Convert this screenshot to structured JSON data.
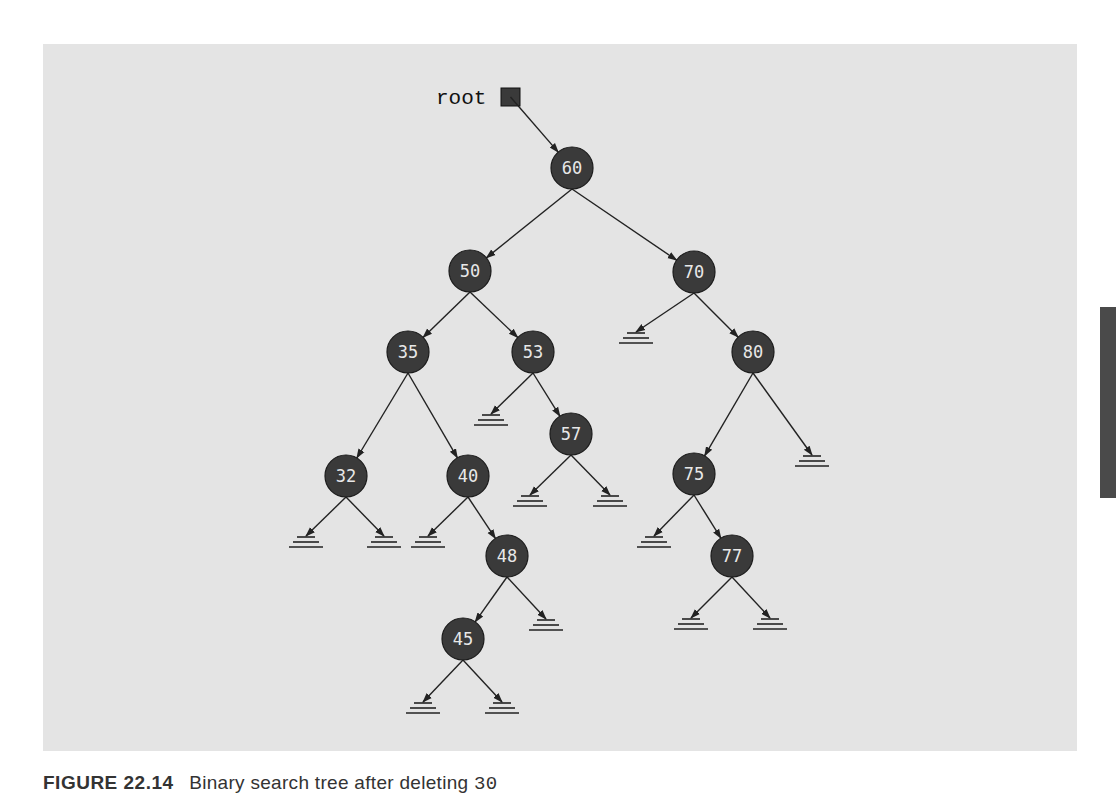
{
  "diagram": {
    "type": "binary-search-tree",
    "root_label": "root",
    "colors": {
      "panel": "#e4e4e4",
      "node_fill": "#3a3a3a",
      "node_text": "#e8e8e8",
      "edge": "#222222",
      "side_tab": "#4a4a4a"
    },
    "root_pointer": {
      "box": [
        501,
        88,
        19,
        18
      ],
      "label_pos": [
        436,
        104
      ]
    },
    "node_radius": 21,
    "nodes": [
      {
        "id": "60",
        "label": "60",
        "x": 572,
        "y": 168
      },
      {
        "id": "50",
        "label": "50",
        "x": 470,
        "y": 271
      },
      {
        "id": "70",
        "label": "70",
        "x": 694,
        "y": 272
      },
      {
        "id": "35",
        "label": "35",
        "x": 408,
        "y": 352
      },
      {
        "id": "53",
        "label": "53",
        "x": 533,
        "y": 352
      },
      {
        "id": "80",
        "label": "80",
        "x": 753,
        "y": 352
      },
      {
        "id": "57",
        "label": "57",
        "x": 571,
        "y": 434
      },
      {
        "id": "32",
        "label": "32",
        "x": 346,
        "y": 476
      },
      {
        "id": "40",
        "label": "40",
        "x": 468,
        "y": 476
      },
      {
        "id": "75",
        "label": "75",
        "x": 694,
        "y": 474
      },
      {
        "id": "48",
        "label": "48",
        "x": 507,
        "y": 556
      },
      {
        "id": "77",
        "label": "77",
        "x": 732,
        "y": 556
      },
      {
        "id": "45",
        "label": "45",
        "x": 463,
        "y": 639
      }
    ],
    "edges": [
      {
        "from": "60",
        "to": "50"
      },
      {
        "from": "60",
        "to": "70"
      },
      {
        "from": "50",
        "to": "35"
      },
      {
        "from": "50",
        "to": "53"
      },
      {
        "from": "35",
        "to": "32"
      },
      {
        "from": "35",
        "to": "40"
      },
      {
        "from": "40",
        "to": "48"
      },
      {
        "from": "48",
        "to": "45"
      },
      {
        "from": "53",
        "to": "57"
      },
      {
        "from": "70",
        "to": "80"
      },
      {
        "from": "80",
        "to": "75"
      },
      {
        "from": "75",
        "to": "77"
      }
    ],
    "null_links": [
      {
        "parent": "70",
        "side": "left",
        "x": 636,
        "y": 333
      },
      {
        "parent": "53",
        "side": "left",
        "x": 491,
        "y": 415
      },
      {
        "parent": "57",
        "side": "left",
        "x": 530,
        "y": 496
      },
      {
        "parent": "57",
        "side": "right",
        "x": 610,
        "y": 496
      },
      {
        "parent": "80",
        "side": "right",
        "x": 812,
        "y": 456
      },
      {
        "parent": "32",
        "side": "left",
        "x": 306,
        "y": 537
      },
      {
        "parent": "32",
        "side": "right",
        "x": 384,
        "y": 537
      },
      {
        "parent": "40",
        "side": "left",
        "x": 428,
        "y": 537
      },
      {
        "parent": "75",
        "side": "left",
        "x": 654,
        "y": 537
      },
      {
        "parent": "48",
        "side": "right",
        "x": 546,
        "y": 620
      },
      {
        "parent": "77",
        "side": "left",
        "x": 691,
        "y": 619
      },
      {
        "parent": "77",
        "side": "right",
        "x": 770,
        "y": 619
      },
      {
        "parent": "45",
        "side": "left",
        "x": 423,
        "y": 703
      },
      {
        "parent": "45",
        "side": "right",
        "x": 502,
        "y": 703
      }
    ]
  },
  "caption": {
    "figure_number": "FIGURE 22.14",
    "text": "Binary search tree after deleting",
    "value": "30"
  }
}
